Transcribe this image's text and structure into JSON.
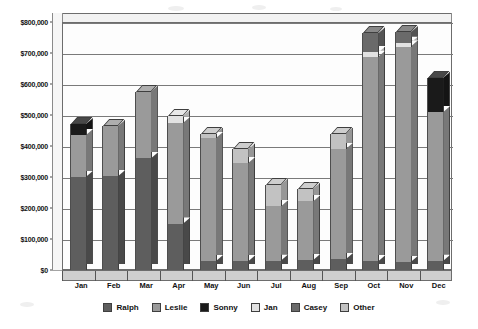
{
  "chart_data": {
    "type": "bar",
    "subtype": "stacked-column-3d",
    "title": "",
    "subtitle": "",
    "xlabel": "",
    "ylabel": "",
    "ylim": [
      0,
      800000
    ],
    "ytick_step": 100000,
    "ytick_labels": [
      "$0",
      "$100,000",
      "$200,000",
      "$300,000",
      "$400,000",
      "$500,000",
      "$600,000",
      "$700,000",
      "$800,000"
    ],
    "ytick_values": [
      0,
      100000,
      200000,
      300000,
      400000,
      500000,
      600000,
      700000,
      800000
    ],
    "grid": true,
    "grid_axis": "y",
    "legend_position": "bottom",
    "categories": [
      "Jan",
      "Feb",
      "Mar",
      "Apr",
      "May",
      "Jun",
      "Jul",
      "Aug",
      "Sep",
      "Oct",
      "Nov",
      "Dec"
    ],
    "series": [
      {
        "name": "Ralph",
        "color": "#5e5e5e",
        "values": [
          300000,
          303000,
          360000,
          150000,
          28000,
          28000,
          30000,
          32000,
          35000,
          28000,
          26000,
          30000
        ]
      },
      {
        "name": "Leslie",
        "color": "#9a9a9a",
        "values": [
          135000,
          162000,
          215000,
          325000,
          397000,
          317000,
          175000,
          190000,
          355000,
          660000,
          695000,
          480000
        ]
      },
      {
        "name": "Sonny",
        "color": "#1a1a1a",
        "values": [
          35000,
          0,
          0,
          0,
          0,
          0,
          0,
          0,
          0,
          0,
          0,
          110000
        ]
      },
      {
        "name": "Jan",
        "color": "#e2e2e2",
        "values": [
          0,
          0,
          0,
          23000,
          0,
          0,
          0,
          0,
          0,
          14000,
          12000,
          0
        ]
      },
      {
        "name": "Casey",
        "color": "#6a6a6a",
        "values": [
          0,
          0,
          0,
          0,
          0,
          0,
          0,
          0,
          0,
          62000,
          34000,
          0
        ]
      },
      {
        "name": "Other",
        "color": "#c2c2c2",
        "values": [
          0,
          0,
          0,
          0,
          15000,
          45000,
          70000,
          40000,
          50000,
          0,
          0,
          0
        ]
      }
    ],
    "totals": [
      470000,
      465000,
      575000,
      498000,
      440000,
      390000,
      275000,
      262000,
      440000,
      764000,
      767000,
      620000
    ]
  },
  "legend": {
    "items": [
      {
        "label": "Ralph",
        "color": "#5e5e5e"
      },
      {
        "label": "Leslie",
        "color": "#9a9a9a"
      },
      {
        "label": "Sonny",
        "color": "#1a1a1a"
      },
      {
        "label": "Jan",
        "color": "#e2e2e2"
      },
      {
        "label": "Casey",
        "color": "#6a6a6a"
      },
      {
        "label": "Other",
        "color": "#c2c2c2"
      }
    ]
  }
}
